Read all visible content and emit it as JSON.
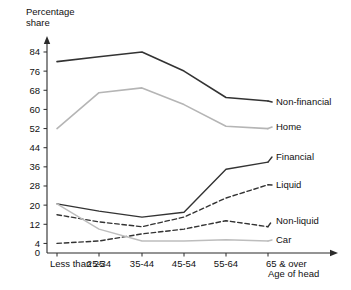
{
  "chart_data": {
    "type": "line",
    "title": "",
    "ylabel": "Percentage\nshare",
    "xlabel": "Age of head",
    "categories": [
      "Less than 25",
      "25-34",
      "35-44",
      "45-54",
      "55-64",
      "65 & over"
    ],
    "ytick_labels": [
      "0",
      "4",
      "12",
      "20",
      "28",
      "36",
      "44",
      "52",
      "60",
      "68",
      "76",
      "84"
    ],
    "ytick_values": [
      0,
      4,
      12,
      20,
      28,
      36,
      44,
      52,
      60,
      68,
      76,
      84
    ],
    "ylim": [
      0,
      88
    ],
    "grid": false,
    "legend_position": "right-inline",
    "series": [
      {
        "name": "Non-financial",
        "label": "Non-financial",
        "style": "solid",
        "color": "#333333",
        "width": 1.6,
        "values": [
          80,
          82,
          84,
          76,
          65,
          63.5
        ]
      },
      {
        "name": "Home",
        "label": "Home",
        "style": "solid",
        "color": "#b5b5b5",
        "width": 1.6,
        "values": [
          52,
          67,
          69,
          62,
          53,
          52
        ]
      },
      {
        "name": "Financial",
        "label": "Financial",
        "style": "solid",
        "color": "#333333",
        "width": 1.4,
        "values": [
          20.5,
          17.5,
          15,
          17,
          35,
          38
        ]
      },
      {
        "name": "Liquid",
        "label": "Liquid",
        "style": "dashed",
        "color": "#333333",
        "width": 1.4,
        "values": [
          16,
          13,
          11,
          15,
          23,
          28.5
        ]
      },
      {
        "name": "Non-liquid",
        "label": "Non-liquid",
        "style": "dashed",
        "color": "#333333",
        "width": 1.4,
        "values": [
          4,
          5,
          8,
          10,
          13.5,
          11
        ]
      },
      {
        "name": "Car",
        "label": "Car",
        "style": "solid",
        "color": "#bdbdbd",
        "width": 1.4,
        "values": [
          20.5,
          10,
          5,
          5,
          5.5,
          5
        ]
      }
    ]
  },
  "axes": {
    "y_title": "Percentage\nshare",
    "x_title": "Age of head"
  }
}
